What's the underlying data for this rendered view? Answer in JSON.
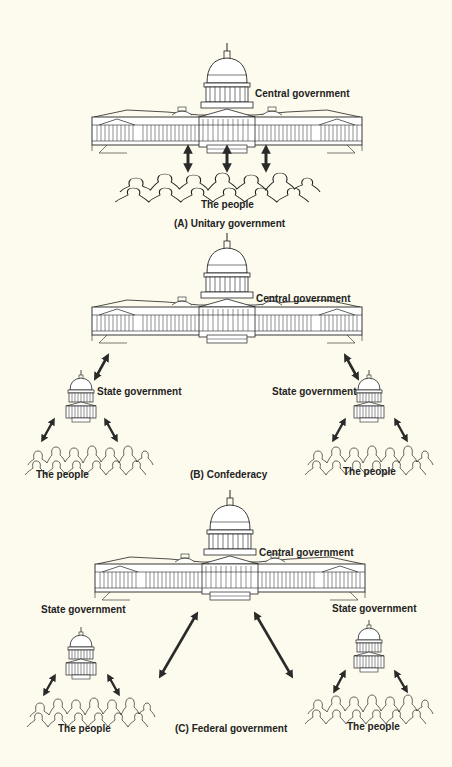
{
  "colors": {
    "background": "#fdfbee",
    "ink": "#222222",
    "arrow": "#2a2a2a"
  },
  "panels": [
    {
      "id": "A",
      "caption": "(A) Unitary government",
      "central_label": "Central government",
      "people_labels": [
        "The people"
      ],
      "state_labels": [],
      "relationships": [
        "central-government <-> the-people (3 arrows)"
      ]
    },
    {
      "id": "B",
      "caption": "(B) Confederacy",
      "central_label": "Central government",
      "state_labels": [
        "State government",
        "State government"
      ],
      "people_labels": [
        "The people",
        "The people"
      ],
      "relationships": [
        "central-government <-> state-government (left)",
        "central-government <-> state-government (right)",
        "state-government <-> the-people (2 arrows each)"
      ]
    },
    {
      "id": "C",
      "caption": "(C) Federal government",
      "central_label": "Central government",
      "state_labels": [
        "State government",
        "State government"
      ],
      "people_labels": [
        "The people",
        "The people"
      ],
      "relationships": [
        "central-government <-> the-people (left, long arrow)",
        "central-government <-> the-people (right, long arrow)",
        "state-government <-> the-people (2 arrows each)"
      ]
    }
  ]
}
